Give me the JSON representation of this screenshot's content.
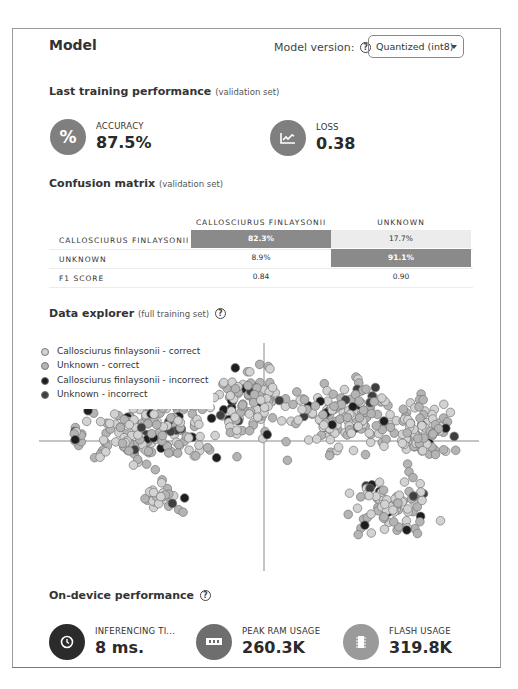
{
  "header": {
    "title": "Model",
    "model_version_label": "Model version:",
    "help_glyph": "?",
    "model_version_selected": "Quantized (int8)"
  },
  "training": {
    "title": "Last training performance",
    "subtitle": "(validation set)",
    "accuracy": {
      "label": "ACCURACY",
      "value": "87.5%",
      "icon": "percent-icon",
      "color": "#7f7f7f"
    },
    "loss": {
      "label": "LOSS",
      "value": "0.38",
      "icon": "line-chart-icon",
      "color": "#7f7f7f"
    }
  },
  "confusion": {
    "title": "Confusion matrix",
    "subtitle": "(validation set)",
    "columns": [
      "CALLOSCIURUS FINLAYSONII",
      "UNKNOWN"
    ],
    "rows": [
      {
        "label": "CALLOSCIURUS FINLAYSONII",
        "cells": [
          "82.3%",
          "17.7%"
        ]
      },
      {
        "label": "UNKNOWN",
        "cells": [
          "8.9%",
          "91.1%"
        ]
      },
      {
        "label": "F1 SCORE",
        "cells": [
          "0.84",
          "0.90"
        ]
      }
    ],
    "colors": {
      "strong": "#8a8a8a",
      "light": "#ececec"
    }
  },
  "explorer": {
    "title": "Data explorer",
    "subtitle": "(full training set)",
    "help_glyph": "?",
    "legend": [
      {
        "label": "Callosciurus finlaysonii - correct",
        "color": "#d2d2d2"
      },
      {
        "label": "Unknown - correct",
        "color": "#b4b4b4"
      },
      {
        "label": "Callosciurus finlaysonii - incorrect",
        "color": "#1e1e1e"
      },
      {
        "label": "Unknown - incorrect",
        "color": "#3f3f3f"
      }
    ]
  },
  "chart_data": {
    "type": "scatter",
    "title": "Data explorer (full training set)",
    "xlabel": "",
    "ylabel": "",
    "axes": {
      "x_axis_y_px": 440,
      "y_axis_x_px": 263,
      "x_range_px": [
        38,
        478
      ],
      "y_range_px": [
        342,
        570
      ]
    },
    "grid": false,
    "legend_position": "top-left",
    "series": [
      {
        "name": "Callosciurus finlaysonii - correct",
        "color": "#d2d2d2",
        "approx_count": 330
      },
      {
        "name": "Unknown - correct",
        "color": "#b4b4b4",
        "approx_count": 250
      },
      {
        "name": "Callosciurus finlaysonii - incorrect",
        "color": "#1e1e1e",
        "approx_count": 45
      },
      {
        "name": "Unknown - incorrect",
        "color": "#3f3f3f",
        "approx_count": 35
      }
    ],
    "clusters": [
      {
        "cx": 150,
        "cy": 430,
        "rx": 95,
        "ry": 45,
        "n": 170
      },
      {
        "cx": 250,
        "cy": 400,
        "rx": 55,
        "ry": 50,
        "n": 110
      },
      {
        "cx": 340,
        "cy": 415,
        "rx": 70,
        "ry": 55,
        "n": 140
      },
      {
        "cx": 420,
        "cy": 430,
        "rx": 45,
        "ry": 50,
        "n": 90
      },
      {
        "cx": 390,
        "cy": 505,
        "rx": 55,
        "ry": 40,
        "n": 85
      },
      {
        "cx": 160,
        "cy": 495,
        "rx": 35,
        "ry": 22,
        "n": 30
      },
      {
        "cx": 75,
        "cy": 435,
        "rx": 14,
        "ry": 12,
        "n": 10
      }
    ],
    "seed": 17
  },
  "ondevice": {
    "title": "On-device performance",
    "help_glyph": "?",
    "metrics": [
      {
        "label": "INFERENCING TI...",
        "value": "8 ms.",
        "icon": "clock-icon",
        "color": "#2b2b2b"
      },
      {
        "label": "PEAK RAM USAGE",
        "value": "260.3K",
        "icon": "ram-icon",
        "color": "#6e6e6e"
      },
      {
        "label": "FLASH USAGE",
        "value": "319.8K",
        "icon": "chip-icon",
        "color": "#9a9a9a"
      }
    ]
  }
}
